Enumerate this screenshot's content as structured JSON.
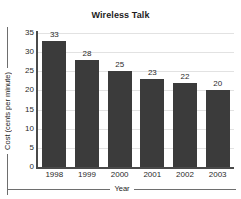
{
  "chart_data": {
    "type": "bar",
    "title": "Wireless Talk",
    "xlabel": "Year",
    "ylabel": "Cost (cents per minute)",
    "categories": [
      "1998",
      "1999",
      "2000",
      "2001",
      "2002",
      "2003"
    ],
    "values": [
      33,
      28,
      25,
      23,
      22,
      20
    ],
    "value_labels": [
      "33",
      "28",
      "25",
      "23",
      "22",
      "20"
    ],
    "ylim": [
      0,
      35
    ],
    "ytick_step": 5,
    "yticks": [
      "35",
      "30",
      "25",
      "20",
      "15",
      "10",
      "5",
      "0"
    ],
    "ytick_values": [
      35,
      30,
      25,
      20,
      15,
      10,
      5,
      0
    ],
    "grid": "horizontal",
    "legend": "none",
    "bar_color": "#3b3b3b",
    "grid_color": "#e2e2e2",
    "axis_color": "#4a4a4a",
    "background": "#ffffff"
  }
}
